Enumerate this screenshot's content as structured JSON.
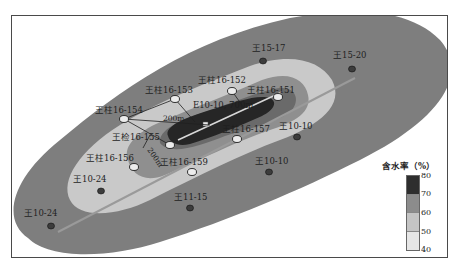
{
  "figure": {
    "legend": {
      "title": "含水率（%）",
      "ticks": [
        "80",
        "70",
        "60",
        "50",
        "40"
      ],
      "classes": [
        {
          "range": "70-80",
          "color": "#2e2e2e"
        },
        {
          "range": "60-70",
          "color": "#8c8c8c"
        },
        {
          "range": "50-60",
          "color": "#c4c4c4"
        },
        {
          "range": "40-50",
          "color": "#e6e6e6"
        }
      ]
    },
    "zone_colors": {
      "outer": "#7e7e7e",
      "light": "#c9c9c9",
      "mid": "#8f8f8f",
      "inner": "#6a6a6a",
      "core": "#262626",
      "background": "#ffffff"
    },
    "horizontal_well": {
      "label": "E10-10, 700m"
    },
    "scale_annotations": [
      "200m",
      "200m"
    ],
    "wells": [
      {
        "id": "w1",
        "label": "王15-17",
        "type": "vertical",
        "x": 263,
        "y": 61
      },
      {
        "id": "w2",
        "label": "王15-20",
        "type": "vertical",
        "x": 352,
        "y": 69
      },
      {
        "id": "w3",
        "label": "王柱16-153",
        "type": "fractured",
        "x": 175,
        "y": 99
      },
      {
        "id": "w4",
        "label": "王柱16-152",
        "type": "fractured",
        "x": 232,
        "y": 91
      },
      {
        "id": "w5",
        "label": "王柱16-151",
        "type": "fractured",
        "x": 278,
        "y": 97
      },
      {
        "id": "w6",
        "label": "王柱16-154",
        "type": "fractured",
        "x": 124,
        "y": 119
      },
      {
        "id": "w7",
        "label": "王检16-155",
        "type": "fractured",
        "x": 170,
        "y": 145
      },
      {
        "id": "w8",
        "label": "王柱16-157",
        "type": "fractured",
        "x": 237,
        "y": 139
      },
      {
        "id": "w9",
        "label": "王柱16-156",
        "type": "fractured",
        "x": 134,
        "y": 167
      },
      {
        "id": "w10",
        "label": "王柱16-159",
        "type": "fractured",
        "x": 192,
        "y": 172
      },
      {
        "id": "w11",
        "label": "王10-10",
        "type": "vertical",
        "x": 297,
        "y": 137
      },
      {
        "id": "w12",
        "label": "王10-10",
        "type": "vertical",
        "x": 269,
        "y": 172
      },
      {
        "id": "w13",
        "label": "王10-24",
        "type": "vertical",
        "x": 101,
        "y": 191
      },
      {
        "id": "w14",
        "label": "王11-15",
        "type": "vertical",
        "x": 190,
        "y": 208
      },
      {
        "id": "w15",
        "label": "王10-24",
        "type": "vertical",
        "x": 51,
        "y": 226
      }
    ],
    "label_positions": [
      {
        "id": "w1",
        "x": 252,
        "y": 51
      },
      {
        "id": "w2",
        "x": 333,
        "y": 58
      },
      {
        "id": "w3",
        "x": 145,
        "y": 93
      },
      {
        "id": "w4",
        "x": 198,
        "y": 83
      },
      {
        "id": "w5",
        "x": 247,
        "y": 93
      },
      {
        "id": "w6",
        "x": 95,
        "y": 113
      },
      {
        "id": "w7",
        "x": 112,
        "y": 140
      },
      {
        "id": "w8",
        "x": 222,
        "y": 132
      },
      {
        "id": "w9",
        "x": 86,
        "y": 161
      },
      {
        "id": "w10",
        "x": 160,
        "y": 165
      },
      {
        "id": "w11",
        "x": 279,
        "y": 129
      },
      {
        "id": "w12",
        "x": 255,
        "y": 164
      },
      {
        "id": "w13",
        "x": 73,
        "y": 182
      },
      {
        "id": "w14",
        "x": 174,
        "y": 200
      },
      {
        "id": "w15",
        "x": 24,
        "y": 216
      }
    ]
  }
}
